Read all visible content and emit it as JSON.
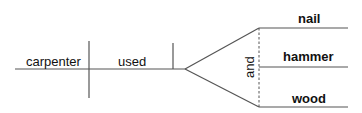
{
  "diagram": {
    "type": "sentence-diagram",
    "subject": "carpenter",
    "verb": "used",
    "conjunction": "and",
    "compound_objects": [
      "nail",
      "hammer",
      "wood"
    ],
    "colors": {
      "line": "#555555",
      "text": "#111111",
      "background": "#ffffff"
    }
  }
}
